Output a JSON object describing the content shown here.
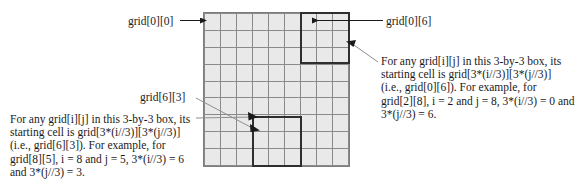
{
  "figure": {
    "grid": {
      "rows": 9,
      "cols": 9,
      "cell_fill": "#e9e9e9",
      "line_color": "#8a8a8a"
    },
    "highlight_color": "#2e2e2e",
    "leader_color": "#9a9a9a"
  },
  "labels": {
    "grid_0_0": "grid[0][0]",
    "grid_0_6": "grid[0][6]",
    "grid_6_3": "grid[6][3]"
  },
  "paragraph_right": {
    "lines": [
      "For any grid[i][j] in this 3-by-3 box, its",
      "starting cell is grid[3*(i//3)][3*(j//3)]",
      "(i.e., grid[0][6]). For example, for",
      "grid[2][8], i = 2 and j = 8, 3*(i//3) = 0 and",
      "3*(j//3) = 6."
    ]
  },
  "paragraph_left": {
    "lines": [
      "For any grid[i][j] in this 3-by-3 box, its",
      "starting cell is grid[3*(i//3)][3*(j//3)]",
      "(i.e., grid[6][3]). For example, for",
      "grid[8][5], i = 8 and j = 5, 3*(i//3) = 6",
      "and 3*(j//3) = 3."
    ]
  },
  "highlighted_boxes": [
    {
      "name": "top-right-box",
      "start_cell": "grid[0][6]",
      "row_range": [
        0,
        2
      ],
      "col_range": [
        6,
        8
      ]
    },
    {
      "name": "bottom-left-box",
      "start_cell": "grid[6][3]",
      "row_range": [
        6,
        8
      ],
      "col_range": [
        3,
        5
      ]
    }
  ]
}
